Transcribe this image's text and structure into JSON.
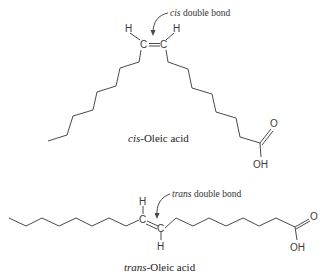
{
  "figure": {
    "molecules": [
      {
        "id": "cis",
        "caption_prefix": "cis",
        "caption_suffix": "-Oleic acid",
        "annotation_prefix": "cis",
        "annotation_suffix": " double bond",
        "atoms": {
          "h1": "H",
          "c1": "C",
          "h2": "H",
          "c2": "C",
          "o": "O",
          "oh": "OH"
        }
      },
      {
        "id": "trans",
        "caption_prefix": "trans",
        "caption_suffix": "-Oleic acid",
        "annotation_prefix": "trans",
        "annotation_suffix": " double bond",
        "atoms": {
          "h1": "H",
          "c1": "C",
          "h2": "H",
          "c2": "C",
          "o": "O",
          "oh": "OH"
        }
      }
    ]
  }
}
